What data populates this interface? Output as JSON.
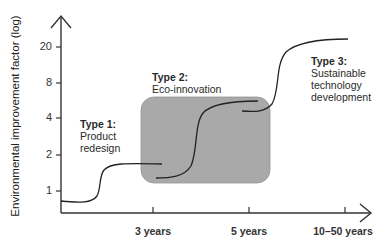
{
  "diagram": {
    "y_axis": {
      "label": "Environmental improvement factor (log)",
      "ticks": [
        "20",
        "8",
        "4",
        "2",
        "1"
      ]
    },
    "x_axis": {
      "ticks": [
        "3 years",
        "5 years",
        "10–50 years"
      ]
    },
    "types": [
      {
        "title": "Type 1:",
        "lines": [
          "Product",
          "redesign"
        ]
      },
      {
        "title": "Type 2:",
        "lines": [
          "Eco-innovation"
        ]
      },
      {
        "title": "Type 3:",
        "lines": [
          "Sustainable",
          "technology",
          "development"
        ]
      }
    ],
    "colors": {
      "axis": "#333333",
      "curve": "#222222",
      "box_fill": "#a9a9a9",
      "box_stroke": "#8c8c8c"
    }
  }
}
